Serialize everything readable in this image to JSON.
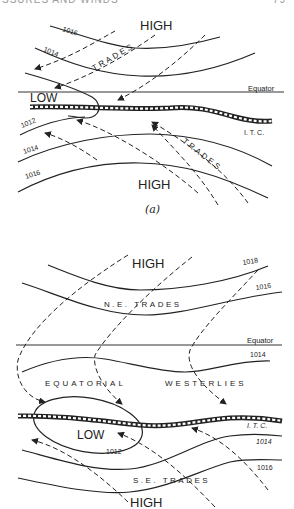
{
  "header": {
    "left": "SSURES AND WINDS",
    "right": "79"
  },
  "diagram_a": {
    "caption": "(a)",
    "high_top": "HIGH",
    "high_bottom": "HIGH",
    "low": "LOW",
    "equator": "Equator",
    "itc": "I. T. C.",
    "trades_top": "TRADES",
    "trades_bottom": "TRADES",
    "isobars": [
      "1016",
      "1014",
      "1012",
      "1014",
      "1016"
    ]
  },
  "diagram_b": {
    "high_top": "HIGH",
    "high_bottom": "HIGH",
    "low": "LOW",
    "equator": "Equator",
    "itc": "I. T. C.",
    "ne_trades": "N.E. TRADES",
    "se_trades": "S.E. TRADES",
    "equatorial": "EQUATORIAL",
    "westerlies": "WESTERLIES",
    "isobars": [
      "1018",
      "1016",
      "1014",
      "1012",
      "1014",
      "1016"
    ]
  }
}
